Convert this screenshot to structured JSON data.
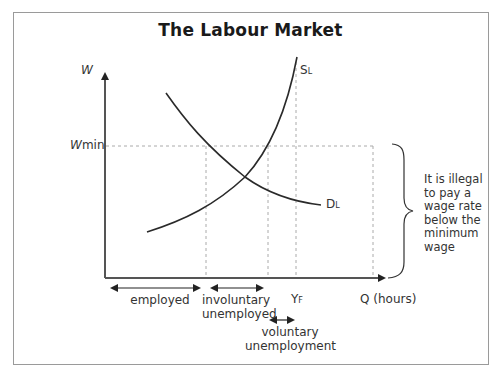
{
  "title": "The Labour Market",
  "axes": {
    "y_label": "W",
    "x_label": "Q (hours)",
    "wmin_label_w": "W",
    "wmin_label_rest": "min",
    "yf_label_main": "Y",
    "yf_label_sub": "F"
  },
  "curves": {
    "supply": {
      "main": "S",
      "sub": "L"
    },
    "demand": {
      "main": "D",
      "sub": "L"
    }
  },
  "ranges": {
    "employed": "employed",
    "involuntary_line1": "involuntary",
    "involuntary_line2": "unemployed",
    "voluntary_line1": "voluntary",
    "voluntary_line2": "unemployment"
  },
  "annotation": {
    "lines": [
      "It is illegal",
      "to pay a",
      "wage rate",
      "below the",
      "minimum",
      "wage"
    ]
  },
  "colors": {
    "curve": "#2a2a2a",
    "axis": "#555555",
    "dashed": "#aaaaaa",
    "frame": "#9a9a9a"
  }
}
